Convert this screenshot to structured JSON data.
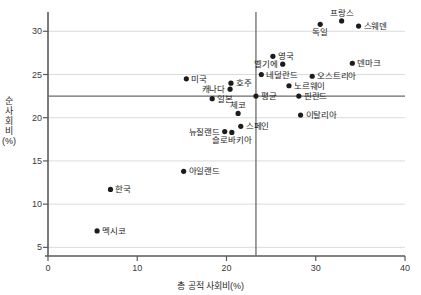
{
  "chart_data": {
    "type": "scatter",
    "title": "",
    "xlabel": "총 공적 사회비(%)",
    "ylabel": "순 사회비(%)",
    "xlim": [
      0,
      40
    ],
    "ylim": [
      4,
      32
    ],
    "xticks": [
      0,
      10,
      20,
      30,
      40
    ],
    "yticks": [
      5,
      10,
      15,
      20,
      25,
      30
    ],
    "grid": "horizontal",
    "legend": "none",
    "reference_lines": {
      "vertical_average_x": 23.3,
      "horizontal_average_y": 22.5,
      "average_label": "평균",
      "color": "#6b6b6b"
    },
    "point_color": "#1c1c1c",
    "points": [
      {
        "label": "프랑스",
        "x": 32.9,
        "y": 31.2,
        "pos": "above"
      },
      {
        "label": "스웨덴",
        "x": 34.8,
        "y": 30.6,
        "pos": "right"
      },
      {
        "label": "독일",
        "x": 30.5,
        "y": 30.8,
        "pos": "below"
      },
      {
        "label": "영국",
        "x": 25.2,
        "y": 27.1,
        "pos": "right"
      },
      {
        "label": "벨기에",
        "x": 26.3,
        "y": 26.2,
        "pos": "left"
      },
      {
        "label": "덴마크",
        "x": 34.1,
        "y": 26.3,
        "pos": "right"
      },
      {
        "label": "네덜란드",
        "x": 23.9,
        "y": 25.0,
        "pos": "right"
      },
      {
        "label": "오스트리아",
        "x": 29.6,
        "y": 24.8,
        "pos": "right"
      },
      {
        "label": "미국",
        "x": 15.5,
        "y": 24.5,
        "pos": "right"
      },
      {
        "label": "호주",
        "x": 20.5,
        "y": 24.0,
        "pos": "right"
      },
      {
        "label": "캐나다",
        "x": 20.4,
        "y": 23.3,
        "pos": "left"
      },
      {
        "label": "노르웨이",
        "x": 27.0,
        "y": 23.7,
        "pos": "right"
      },
      {
        "label": "일본",
        "x": 18.4,
        "y": 22.2,
        "pos": "right"
      },
      {
        "label": "핀란드",
        "x": 28.1,
        "y": 22.5,
        "pos": "right"
      },
      {
        "label": "체코",
        "x": 21.3,
        "y": 20.5,
        "pos": "above"
      },
      {
        "label": "이탈리아",
        "x": 28.3,
        "y": 20.3,
        "pos": "right"
      },
      {
        "label": "스페인",
        "x": 21.6,
        "y": 19.0,
        "pos": "right"
      },
      {
        "label": "뉴질랜드",
        "x": 19.8,
        "y": 18.4,
        "pos": "left"
      },
      {
        "label": "슬로바키아",
        "x": 20.6,
        "y": 18.3,
        "pos": "below"
      },
      {
        "label": "아일랜드",
        "x": 15.2,
        "y": 13.8,
        "pos": "right"
      },
      {
        "label": "한국",
        "x": 7.0,
        "y": 11.7,
        "pos": "right"
      },
      {
        "label": "멕시코",
        "x": 5.5,
        "y": 6.9,
        "pos": "right"
      }
    ]
  }
}
